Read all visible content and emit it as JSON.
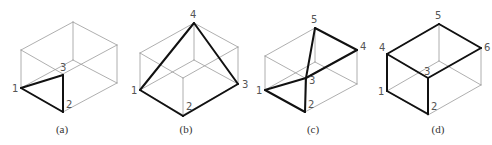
{
  "colors": {
    "thin_edge": "#9a9a9a",
    "thick_edge": "#111111",
    "label": "#555555",
    "caption": "#333333"
  },
  "figures": [
    {
      "id": "a",
      "caption": "(a)",
      "caption_pos": [
        62,
        133
      ],
      "box": {
        "tl": [
          21,
          50
        ],
        "tb": [
          73,
          22
        ],
        "tr": [
          117,
          45
        ],
        "tf": [
          63,
          74
        ],
        "h": 38
      },
      "points": {
        "1": [
          21,
          88
        ],
        "2": [
          63,
          112
        ],
        "3": [
          63,
          75
        ]
      },
      "labels": [
        {
          "text": "1",
          "pos": [
            12,
            92
          ]
        },
        {
          "text": "2",
          "pos": [
            66,
            108
          ]
        },
        {
          "text": "3",
          "pos": [
            60,
            71
          ]
        }
      ],
      "thick_edges": [
        [
          "1",
          "2"
        ],
        [
          "2",
          "3"
        ],
        [
          "3",
          "1"
        ]
      ]
    },
    {
      "id": "b",
      "caption": "(b)",
      "caption_pos": [
        186,
        133
      ],
      "box": {
        "tl": [
          140,
          53
        ],
        "tb": [
          194,
          23
        ],
        "tr": [
          238,
          47
        ],
        "tf": [
          183,
          78
        ],
        "h": 37
      },
      "points": {
        "1": [
          140,
          90
        ],
        "2": [
          183,
          116
        ],
        "3": [
          238,
          84
        ],
        "4": [
          194,
          23
        ]
      },
      "labels": [
        {
          "text": "1",
          "pos": [
            131,
            94
          ]
        },
        {
          "text": "2",
          "pos": [
            186,
            110
          ]
        },
        {
          "text": "3",
          "pos": [
            242,
            88
          ]
        },
        {
          "text": "4",
          "pos": [
            190,
            18
          ]
        }
      ],
      "thick_edges": [
        [
          "1",
          "2"
        ],
        [
          "2",
          "3"
        ],
        [
          "1",
          "4"
        ],
        [
          "4",
          "3"
        ]
      ]
    },
    {
      "id": "c",
      "caption": "(c)",
      "caption_pos": [
        313,
        133
      ],
      "box": {
        "tl": [
          265,
          56
        ],
        "tb": [
          315,
          28
        ],
        "tr": [
          357,
          50
        ],
        "tf": [
          305,
          78
        ],
        "h": 34
      },
      "points": {
        "1": [
          265,
          90
        ],
        "2": [
          305,
          112
        ],
        "3": [
          306,
          78
        ],
        "4": [
          357,
          50
        ],
        "5": [
          315,
          28
        ]
      },
      "labels": [
        {
          "text": "1",
          "pos": [
            256,
            94
          ]
        },
        {
          "text": "2",
          "pos": [
            308,
            108
          ]
        },
        {
          "text": "3",
          "pos": [
            309,
            84
          ]
        },
        {
          "text": "4",
          "pos": [
            360,
            50
          ]
        },
        {
          "text": "5",
          "pos": [
            311,
            23
          ]
        }
      ],
      "thick_edges": [
        [
          "1",
          "2"
        ],
        [
          "2",
          "3"
        ],
        [
          "1",
          "3"
        ],
        [
          "3",
          "5"
        ],
        [
          "5",
          "4"
        ],
        [
          "4",
          "3"
        ]
      ]
    },
    {
      "id": "d",
      "caption": "(d)",
      "caption_pos": [
        438,
        133
      ],
      "box": {
        "tl": [
          387,
          54
        ],
        "tb": [
          439,
          24
        ],
        "tr": [
          481,
          48
        ],
        "tf": [
          428,
          78
        ],
        "h": 37
      },
      "points": {
        "1": [
          387,
          91
        ],
        "2": [
          428,
          114
        ],
        "3": [
          428,
          78
        ],
        "4": [
          387,
          54
        ],
        "5": [
          439,
          24
        ],
        "6": [
          481,
          48
        ]
      },
      "labels": [
        {
          "text": "1",
          "pos": [
            378,
            95
          ]
        },
        {
          "text": "2",
          "pos": [
            431,
            110
          ]
        },
        {
          "text": "3",
          "pos": [
            424,
            75
          ]
        },
        {
          "text": "4",
          "pos": [
            379,
            51
          ]
        },
        {
          "text": "5",
          "pos": [
            435,
            19
          ]
        },
        {
          "text": "6",
          "pos": [
            484,
            51
          ]
        }
      ],
      "thick_edges": [
        [
          "4",
          "5"
        ],
        [
          "5",
          "6"
        ],
        [
          "6",
          "3"
        ],
        [
          "3",
          "4"
        ],
        [
          "4",
          "1"
        ],
        [
          "1",
          "2"
        ],
        [
          "2",
          "3"
        ]
      ]
    }
  ]
}
